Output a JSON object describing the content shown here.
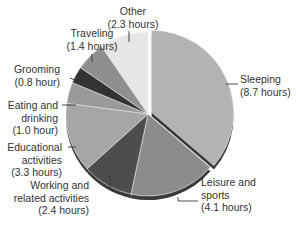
{
  "chart_data": {
    "type": "pie",
    "title": "",
    "unit": "hours",
    "total": 24.0,
    "start_angle_deg": 0,
    "direction": "clockwise",
    "categories": [
      "Sleeping",
      "Leisure and sports",
      "Working and related activities",
      "Educational activities",
      "Eating and drinking",
      "Grooming",
      "Traveling",
      "Other"
    ],
    "values": [
      8.7,
      4.1,
      2.4,
      3.3,
      1.0,
      0.8,
      1.4,
      2.3
    ],
    "colors": [
      "#b3b3b3",
      "#8c8c8c",
      "#4d4d4d",
      "#a6a6a6",
      "#999999",
      "#333333",
      "#8f8f8f",
      "#e6e6e6"
    ],
    "exploded": [
      "Sleeping"
    ],
    "legend": "none (callout labels)"
  },
  "labels": {
    "sleeping": {
      "line1": "Sleeping",
      "line2": "(8.7 hours)"
    },
    "leisure": {
      "line1": "Leisure and",
      "line2": "sports",
      "line3": "(4.1 hours)"
    },
    "working": {
      "line1": "Working and",
      "line2": "related activities",
      "line3": "(2.4 hours)"
    },
    "educational": {
      "line1": "Educational",
      "line2": "activities",
      "line3": "(3.3 hours)"
    },
    "eating": {
      "line1": "Eating and",
      "line2": "drinking",
      "line3": "(1.0 hour)"
    },
    "grooming": {
      "line1": "Grooming",
      "line2": "(0.8 hour)"
    },
    "traveling": {
      "line1": "Traveling",
      "line2": "(1.4 hours)"
    },
    "other": {
      "line1": "Other",
      "line2": "(2.3 hours)"
    }
  }
}
